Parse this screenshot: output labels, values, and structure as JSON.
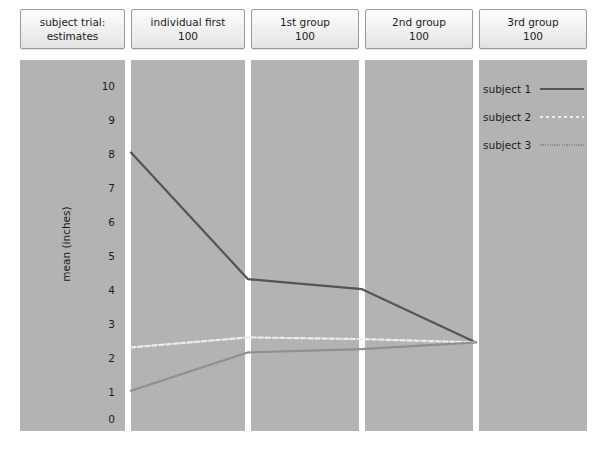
{
  "chart_data": {
    "type": "line",
    "title": "",
    "xlabel": "",
    "ylabel": "mean (inches)",
    "ylim": [
      0,
      10
    ],
    "yticks": [
      10,
      9,
      8,
      7,
      6,
      5,
      4,
      3,
      2,
      1,
      0
    ],
    "grid": false,
    "legend_position": "top-right",
    "panel_layout": "5 vertical strip panels separated by white gutters",
    "panels": [
      {
        "line1": "subject trial:",
        "line2": "estimates"
      },
      {
        "line1": "individual first",
        "line2": "100"
      },
      {
        "line1": "1st group",
        "line2": "100"
      },
      {
        "line1": "2nd group",
        "line2": "100"
      },
      {
        "line1": "3rd group",
        "line2": "100"
      }
    ],
    "x": [
      "individual first",
      "1st group",
      "2nd group",
      "3rd group"
    ],
    "series": [
      {
        "name": "subject 1",
        "values": [
          8.0,
          4.2,
          3.9,
          2.3
        ],
        "style": "solid",
        "color": "#555555"
      },
      {
        "name": "subject 2",
        "values": [
          2.15,
          2.45,
          2.4,
          2.3
        ],
        "style": "dashed",
        "color": "#ececec"
      },
      {
        "name": "subject 3",
        "values": [
          0.85,
          2.0,
          2.1,
          2.3
        ],
        "style": "dotted",
        "color": "#8f8f8f"
      }
    ],
    "legend": [
      {
        "label": "subject 1",
        "key": "solid-line-key"
      },
      {
        "label": "subject 2",
        "key": "dashed-line-key"
      },
      {
        "label": "subject 3",
        "key": "dotted-line-key"
      }
    ],
    "colors": {
      "panel_background": "#b3b3b3",
      "page_background": "#ffffff",
      "text": "#1b1b1b",
      "header_border": "#9a9a9a",
      "subject1": "#555555",
      "subject2": "#ececec",
      "subject3": "#8f8f8f"
    }
  },
  "yticks": {
    "t0": "10",
    "t1": "9",
    "t2": "8",
    "t3": "7",
    "t4": "6",
    "t5": "5",
    "t6": "4",
    "t7": "3",
    "t8": "2",
    "t9": "1",
    "t10": "0"
  },
  "axis": {
    "ylabel": "mean (inches)"
  },
  "headers": {
    "h0l1": "subject trial:",
    "h0l2": "estimates",
    "h1l1": "individual first",
    "h1l2": "100",
    "h2l1": "1st group",
    "h2l2": "100",
    "h3l1": "2nd group",
    "h3l2": "100",
    "h4l1": "3rd group",
    "h4l2": "100"
  },
  "legend": {
    "s1": "subject 1",
    "s2": "subject 2",
    "s3": "subject 3"
  }
}
